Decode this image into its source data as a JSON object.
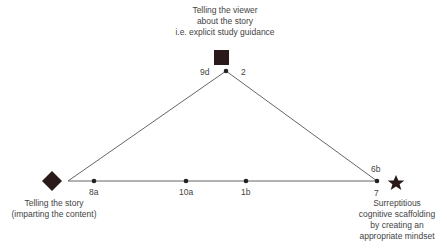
{
  "diagram": {
    "vertices": {
      "top": {
        "label_lines": [
          "Telling the viewer",
          "about the story",
          "i.e. explicit study guidance"
        ],
        "marker": "square",
        "points": [
          "9d",
          "2"
        ]
      },
      "left": {
        "label_lines": [
          "Telling the story",
          "(imparting the content)"
        ],
        "marker": "diamond"
      },
      "right": {
        "label_lines": [
          "Surreptitious",
          "cognitive scaffolding",
          "by creating an",
          "appropriate mindset"
        ],
        "marker": "star",
        "points": [
          "6b",
          "7"
        ]
      }
    },
    "base_points": [
      "8a",
      "10a",
      "1b"
    ],
    "colors": {
      "marker": "#2b1a1a",
      "line": "#555555",
      "text": "#444444"
    }
  }
}
